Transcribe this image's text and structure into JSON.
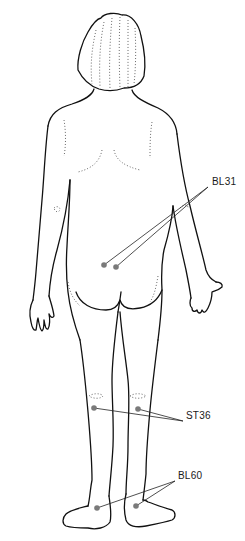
{
  "diagram": {
    "colors": {
      "outline": "#111111",
      "point": "#7a7a7a",
      "leader": "#222222",
      "text": "#1a1a1a"
    },
    "points": [
      {
        "id": "BL31",
        "label": "BL31",
        "label_pos": [
          212,
          182
        ],
        "anchor": [
          208,
          187
        ],
        "dots": [
          [
            104,
            265
          ],
          [
            116,
            267
          ]
        ]
      },
      {
        "id": "ST36",
        "label": "ST36",
        "label_pos": [
          186,
          416
        ],
        "anchor": [
          183,
          421
        ],
        "dots": [
          [
            94,
            408
          ],
          [
            138,
            409
          ]
        ]
      },
      {
        "id": "BL60",
        "label": "BL60",
        "label_pos": [
          178,
          476
        ],
        "anchor": [
          175,
          481
        ],
        "dots": [
          [
            97,
            508
          ],
          [
            136,
            506
          ]
        ]
      }
    ]
  }
}
